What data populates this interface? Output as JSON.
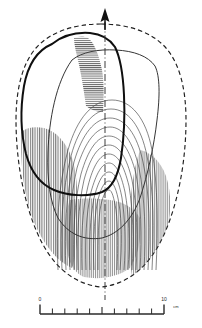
{
  "figure": {
    "kind": "archaeological-line-drawing",
    "background_color": "#ffffff",
    "ink_color": "#1a1a1a",
    "hatch_color": "#555555",
    "contour_color": "#3a3a3a",
    "width_px": 202,
    "height_px": 328
  },
  "north_arrow": {
    "name": "north-arrow",
    "shape": "solid-triangle-up",
    "color": "#111111",
    "tip_x": 105,
    "tip_y": 9,
    "base_y": 24
  },
  "axis_line": {
    "name": "center-axis",
    "style": "dash-dot",
    "x": 105,
    "y_top": 22,
    "y_bottom": 300,
    "color": "#333333"
  },
  "outlines": [
    {
      "name": "outer-boundary",
      "style": "dashed",
      "stroke_width": 1.1,
      "description": "dashed outer perimeter of the object"
    },
    {
      "name": "bold-inner-outline",
      "style": "solid",
      "stroke_width": 2.0,
      "description": "heavy solid outline of upper-left surface facet"
    },
    {
      "name": "secondary-outline",
      "style": "solid",
      "stroke_width": 0.9,
      "description": "thin inner outline following the bold outline"
    }
  ],
  "contours": {
    "name": "nested-contour-arcs",
    "count": 11,
    "style": "solid",
    "stroke_width": 0.6,
    "description": "concentric U-shaped / horseshoe arcs in the central area"
  },
  "hatching": [
    {
      "name": "hatch-upper-central",
      "direction": "horizontal",
      "description": "dense horizontal hatching along the upper central ridge"
    },
    {
      "name": "hatch-left-lower",
      "direction": "vertical",
      "description": "vertical hatch shading at lower-left interior"
    },
    {
      "name": "hatch-right-lower",
      "direction": "vertical",
      "description": "vertical hatch shading at lower-right interior"
    },
    {
      "name": "hatch-bottom-center",
      "direction": "vertical",
      "description": "vertical hatch shading along bottom centre"
    }
  ],
  "scale_bar": {
    "name": "scale-bar",
    "min_label": "0",
    "max_label": "10",
    "unit_label": "cm",
    "divisions": 10,
    "x_start": 40,
    "x_end": 164,
    "baseline_y": 314,
    "color": "#2a2a2a"
  }
}
